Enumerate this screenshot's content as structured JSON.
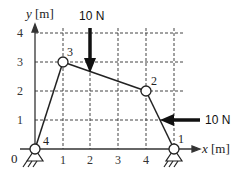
{
  "diagram": {
    "type": "truss",
    "axes": {
      "x_label": "x [m]",
      "y_label": "y [m]",
      "origin_label": "0",
      "x_ticks": [
        "1",
        "2",
        "3",
        "4"
      ],
      "y_ticks": [
        "1",
        "2",
        "3",
        "4"
      ]
    },
    "nodes": [
      {
        "id": "1",
        "x": 5,
        "y": 0,
        "support": "pin"
      },
      {
        "id": "2",
        "x": 4,
        "y": 2
      },
      {
        "id": "3",
        "x": 1,
        "y": 3
      },
      {
        "id": "4",
        "x": 0,
        "y": 0,
        "support": "pin"
      }
    ],
    "members": [
      {
        "from": "4",
        "to": "3"
      },
      {
        "from": "3",
        "to": "2"
      },
      {
        "from": "2",
        "to": "1"
      }
    ],
    "loads": [
      {
        "label": "10 N",
        "direction": "down",
        "applied_at": "member 3-2 at x=2"
      },
      {
        "label": "10 N",
        "direction": "left",
        "applied_at": "member 2-1 at y=1"
      }
    ],
    "colors": {
      "line": "#222222",
      "grid": "#333333",
      "background": "#ffffff"
    }
  }
}
